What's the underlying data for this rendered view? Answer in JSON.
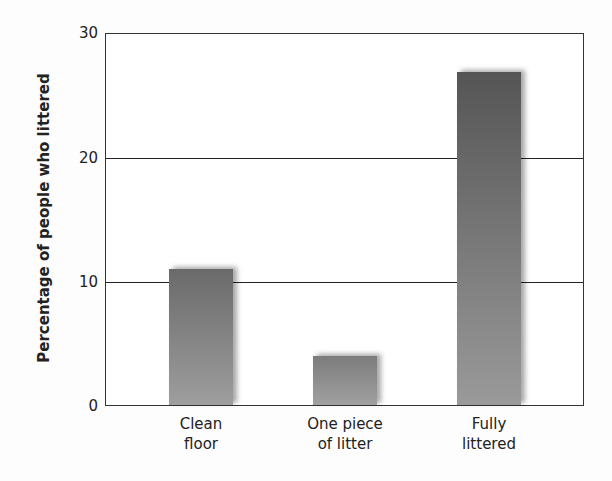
{
  "chart_data": {
    "type": "bar",
    "title": "",
    "xlabel": "",
    "ylabel": "Percentage of people who littered",
    "ylim": [
      0,
      30
    ],
    "yticks": [
      0,
      10,
      20,
      30
    ],
    "grid": true,
    "legend": null,
    "categories": [
      "Clean floor",
      "One piece of litter",
      "Fully littered"
    ],
    "category_lines": [
      [
        "Clean",
        "floor"
      ],
      [
        "One piece",
        "of litter"
      ],
      [
        "Fully",
        "littered"
      ]
    ],
    "values": [
      11,
      4,
      27
    ],
    "bar_colors": [
      {
        "top": "#6a6a6a",
        "bottom": "#9e9e9e"
      },
      {
        "top": "#7c7c7c",
        "bottom": "#a0a0a0"
      },
      {
        "top": "#555555",
        "bottom": "#9a9a9a"
      }
    ]
  },
  "axis": {
    "ylabel": "Percentage of people who littered",
    "ticks": [
      "0",
      "10",
      "20",
      "30"
    ]
  },
  "labels": [
    {
      "line1": "Clean",
      "line2": "floor"
    },
    {
      "line1": "One piece",
      "line2": "of litter"
    },
    {
      "line1": "Fully",
      "line2": "littered"
    }
  ]
}
